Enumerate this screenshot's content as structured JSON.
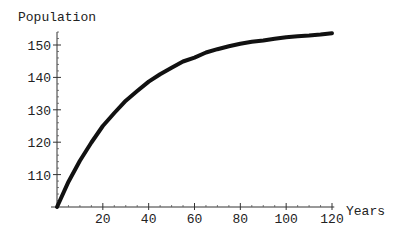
{
  "chart_data": {
    "type": "line",
    "title": "",
    "xlabel": "Years",
    "ylabel": "Population",
    "xlim": [
      0,
      120
    ],
    "ylim": [
      100,
      155
    ],
    "x_ticks": [
      20,
      40,
      60,
      80,
      100,
      120
    ],
    "y_ticks": [
      110,
      120,
      130,
      140,
      150
    ],
    "grid": false,
    "legend": null,
    "series": [
      {
        "name": "Population",
        "x": [
          0,
          5,
          10,
          15,
          20,
          25,
          30,
          35,
          40,
          45,
          50,
          55,
          60,
          65,
          70,
          75,
          80,
          85,
          90,
          95,
          100,
          105,
          110,
          115,
          120
        ],
        "values": [
          100,
          107.8,
          114.3,
          119.9,
          125.0,
          129.0,
          132.8,
          135.8,
          138.7,
          141.0,
          143.0,
          144.9,
          146.1,
          147.7,
          148.7,
          149.6,
          150.4,
          151.0,
          151.4,
          151.9,
          152.4,
          152.7,
          152.9,
          153.2,
          153.6
        ]
      }
    ]
  }
}
